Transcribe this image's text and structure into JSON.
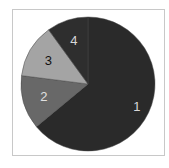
{
  "chart_data": {
    "type": "pie",
    "title": "",
    "start": "top",
    "direction": "clockwise",
    "legend": "none",
    "slices": [
      {
        "label": "1",
        "value": 64,
        "color": "#2a2a2a",
        "label_color": "#d8d8d8"
      },
      {
        "label": "2",
        "value": 13,
        "color": "#686868",
        "label_color": "#e0e0e0"
      },
      {
        "label": "3",
        "value": 13,
        "color": "#a4a4a4",
        "label_color": "#111111"
      },
      {
        "label": "4",
        "value": 10,
        "color": "#2e2e2e",
        "label_color": "#d8d8d8"
      }
    ]
  }
}
